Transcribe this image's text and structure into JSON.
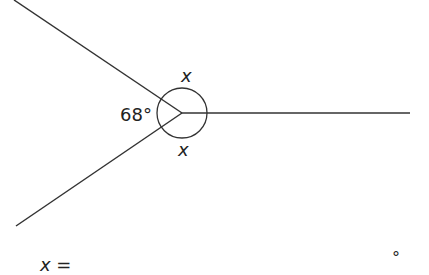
{
  "diagram": {
    "vertex": {
      "x": 182,
      "y": 113
    },
    "rays": [
      {
        "name": "upper-left-ray",
        "x2": 14,
        "y2": 0
      },
      {
        "name": "lower-left-ray",
        "x2": 16,
        "y2": 226
      },
      {
        "name": "right-ray",
        "x2": 410,
        "y2": 113
      }
    ],
    "angle_arc_radius": 25,
    "labels": {
      "known_angle": "68°",
      "upper_angle": "x",
      "lower_angle": "x"
    },
    "line_color": "#333333"
  },
  "answer": {
    "prefix": "x =",
    "suffix": "°"
  }
}
